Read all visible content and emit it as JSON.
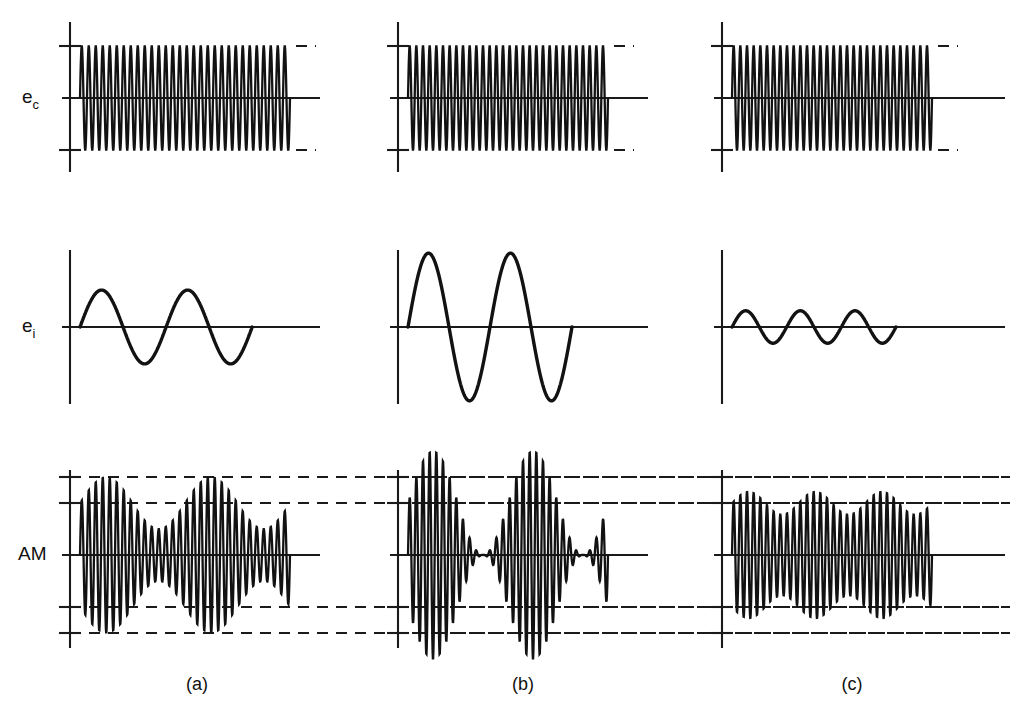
{
  "figure": {
    "background_color": "#ffffff",
    "trace_color": "#121212",
    "axis_color": "#1a1a1a",
    "dash_color": "#1a1a1a"
  },
  "row_labels": [
    {
      "id": "carrier",
      "base": "e",
      "sub": "c",
      "text": "ec"
    },
    {
      "id": "information",
      "base": "e",
      "sub": "i",
      "text": "ei"
    },
    {
      "id": "am",
      "base": "AM",
      "sub": "",
      "text": "AM"
    }
  ],
  "column_labels": [
    {
      "id": "a",
      "text": "(a)"
    },
    {
      "id": "b",
      "text": "(b)"
    },
    {
      "id": "c",
      "text": "(c)"
    }
  ],
  "chart_data": {
    "type": "line",
    "xlabel": "",
    "ylabel": "",
    "grid": false,
    "legend": "none",
    "panels": [
      {
        "column": "(a)",
        "row": "ec",
        "name": "carrier-a",
        "waveform": "sine",
        "cycles": 30,
        "amplitude": 1.0,
        "description": "Constant amplitude carrier"
      },
      {
        "column": "(a)",
        "row": "ei",
        "name": "information-a",
        "waveform": "sine",
        "cycles": 2,
        "amplitude": 0.5,
        "description": "Medium amplitude modulating signal"
      },
      {
        "column": "(a)",
        "row": "AM",
        "name": "am-a",
        "waveform": "am",
        "carrier_cycles": 30,
        "modulation_cycles": 2,
        "modulation_index": 0.5,
        "description": "Less than 100 percent modulation",
        "dash_levels": [
          1.5,
          1.0,
          -1.0,
          -1.5
        ]
      },
      {
        "column": "(b)",
        "row": "ec",
        "name": "carrier-b",
        "waveform": "sine",
        "cycles": 30,
        "amplitude": 1.0,
        "description": "Constant amplitude carrier"
      },
      {
        "column": "(b)",
        "row": "ei",
        "name": "information-b",
        "waveform": "sine",
        "cycles": 2,
        "amplitude": 1.0,
        "description": "Large amplitude modulating signal"
      },
      {
        "column": "(b)",
        "row": "AM",
        "name": "am-b",
        "waveform": "am",
        "carrier_cycles": 30,
        "modulation_cycles": 2,
        "modulation_index": 1.0,
        "description": "100 percent modulation",
        "dash_levels": [
          1.5,
          1.0,
          -1.0,
          -1.5
        ]
      },
      {
        "column": "(c)",
        "row": "ec",
        "name": "carrier-c",
        "waveform": "sine",
        "cycles": 30,
        "amplitude": 1.0,
        "description": "Constant amplitude carrier"
      },
      {
        "column": "(c)",
        "row": "ei",
        "name": "information-c",
        "waveform": "sine",
        "cycles": 3,
        "amplitude": 0.22,
        "description": "Small amplitude higher frequency modulating signal"
      },
      {
        "column": "(c)",
        "row": "AM",
        "name": "am-c",
        "waveform": "am",
        "carrier_cycles": 30,
        "modulation_cycles": 3,
        "modulation_index": 0.22,
        "description": "Low percentage modulation",
        "dash_levels": [
          1.5,
          1.0,
          -1.0,
          -1.5
        ]
      }
    ]
  },
  "geometry": {
    "columns": [
      {
        "id": "a",
        "axis_x": 70,
        "wave_start": 80,
        "wave_end": 290,
        "axis_right": 320,
        "label_x": 197
      },
      {
        "id": "b",
        "axis_x": 398,
        "wave_start": 408,
        "wave_end": 608,
        "axis_right": 648,
        "label_x": 523
      },
      {
        "id": "c",
        "axis_x": 722,
        "wave_start": 732,
        "wave_end": 932,
        "axis_right": 1005,
        "label_x": 852
      }
    ],
    "rows": [
      {
        "id": "carrier",
        "baseline": 98,
        "axis_top": 22,
        "axis_bottom": 172,
        "unit": 52,
        "label_x": 22,
        "label_y": 103
      },
      {
        "id": "information",
        "baseline": 327,
        "axis_top": 250,
        "axis_bottom": 404,
        "unit": 52,
        "label_x": 22,
        "label_y": 332
      },
      {
        "id": "am",
        "baseline": 555,
        "axis_top": 470,
        "axis_bottom": 648,
        "unit": 52,
        "label_x": 18,
        "label_y": 560
      }
    ],
    "column_label_y": 690,
    "dash_right_extent": 1010
  }
}
